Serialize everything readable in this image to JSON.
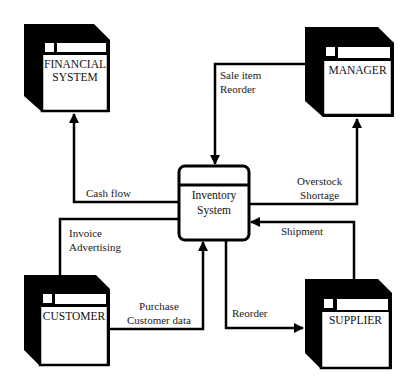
{
  "diagram": {
    "type": "context-diagram",
    "process": {
      "line1": "Inventory",
      "line2": "System"
    },
    "entities": {
      "financial": {
        "line1": "FINANCIAL",
        "line2": "SYSTEM"
      },
      "manager": {
        "line1": "MANAGER"
      },
      "customer": {
        "line1": "CUSTOMER"
      },
      "supplier": {
        "line1": "SUPPLIER"
      }
    },
    "flows": {
      "cash_flow": {
        "line1": "Cash flow",
        "from": "Inventory System",
        "to": "FINANCIAL SYSTEM"
      },
      "sale_item": {
        "line1": "Sale item",
        "line2": "Reorder",
        "from": "MANAGER",
        "to": "Inventory System"
      },
      "overstock": {
        "line1": "Overstock",
        "line2": "Shortage",
        "from": "Inventory System",
        "to": "MANAGER"
      },
      "invoice": {
        "line1": "Invoice",
        "line2": "Advertising",
        "from": "Inventory System",
        "to": "CUSTOMER"
      },
      "shipment": {
        "line1": "Shipment",
        "from": "SUPPLIER",
        "to": "Inventory System"
      },
      "purchase": {
        "line1": "Purchase",
        "line2": "Customer data",
        "from": "CUSTOMER",
        "to": "Inventory System"
      },
      "reorder": {
        "line1": "Reorder",
        "from": "Inventory System",
        "to": "SUPPLIER"
      }
    },
    "colors": {
      "ink": "#000000",
      "background": "#ffffff"
    }
  }
}
